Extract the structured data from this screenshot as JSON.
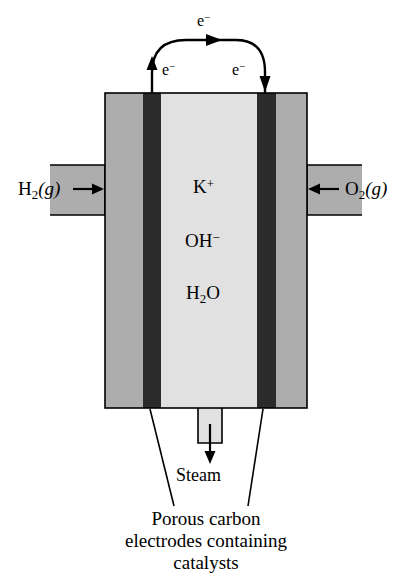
{
  "figure": {
    "type": "schematic-diagram",
    "width": 412,
    "height": 581
  },
  "colors": {
    "background": "#ffffff",
    "gas_compartment_gray": "#adadad",
    "electrode_dark": "#2b2b2b",
    "electrolyte_light": "#e1e1e1",
    "outline": "#000000",
    "text": "#000000"
  },
  "labels": {
    "hydrogen": {
      "formula": "H",
      "subscript": "2",
      "state": "(g)"
    },
    "oxygen": {
      "formula": "O",
      "subscript": "2",
      "state": "(g)"
    },
    "electron_top": {
      "symbol": "e",
      "charge": "−"
    },
    "electron_left": {
      "symbol": "e",
      "charge": "−"
    },
    "electron_right": {
      "symbol": "e",
      "charge": "−"
    },
    "steam": "Steam"
  },
  "electrolyte_species": [
    {
      "formula": "K",
      "superscript": "+",
      "subscript": ""
    },
    {
      "formula": "OH",
      "superscript": "−",
      "subscript": ""
    },
    {
      "formula": "H",
      "subscript": "2",
      "tail": "O"
    }
  ],
  "caption": {
    "line1": "Porous carbon",
    "line2": "electrodes containing",
    "line3": "catalysts"
  },
  "flow": {
    "inlet_left": "H2 gas enters left compartment",
    "inlet_right": "O2 gas enters right compartment",
    "outlet_bottom": "Steam exits bottom",
    "circuit_direction": "electrons flow from left electrode over the top wire to the right electrode"
  }
}
